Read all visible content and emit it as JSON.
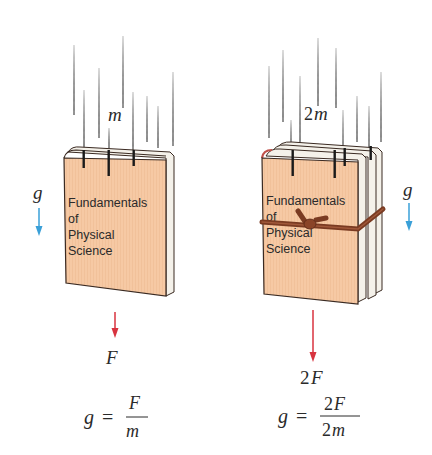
{
  "figure": {
    "colors": {
      "book_cover": "#f6c9a4",
      "book_outline": "#3a2a22",
      "pages": "#f4f1ea",
      "rain": "#222222",
      "gravity_arrow": "#3aa0d8",
      "force_arrow": "#d8333f",
      "string": "#7a3b22",
      "text": "#2a2a2a"
    }
  },
  "left_panel": {
    "mass_label": "m",
    "gravity_label": "g",
    "book_title_lines": [
      "Fundamentals",
      "of",
      "Physical",
      "Science"
    ],
    "force_label": "F",
    "equation": {
      "lhs": "g",
      "equals": "=",
      "numerator": "F",
      "denominator": "m"
    }
  },
  "right_panel": {
    "mass_label": "2m",
    "mass_coef": "2",
    "mass_var": "m",
    "gravity_label": "g",
    "book_title_lines": [
      "Fundamentals",
      "of",
      "Physical",
      "Science"
    ],
    "force_label": "2F",
    "force_coef": "2",
    "force_var": "F",
    "equation": {
      "lhs": "g",
      "equals": "=",
      "numerator_coef": "2",
      "numerator_var": "F",
      "denominator_coef": "2",
      "denominator_var": "m"
    }
  }
}
